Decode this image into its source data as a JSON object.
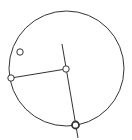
{
  "diagram": {
    "type": "geometry",
    "canvas": {
      "width": 132,
      "height": 140,
      "background": "#ffffff"
    },
    "stroke_color": "#333333",
    "circle": {
      "cx": 66.5,
      "cy": 68.5,
      "r": 57.5
    },
    "segments": [
      {
        "name": "radius-segment",
        "x1": 11,
        "y1": 78,
        "x2": 66,
        "y2": 69
      },
      {
        "name": "diameter-line",
        "x1": 62,
        "y1": 44,
        "x2": 78,
        "y2": 138
      }
    ],
    "points": [
      {
        "name": "free-point",
        "x": 20,
        "y": 52,
        "r": 3.2,
        "stroke_width": 1
      },
      {
        "name": "left-point",
        "x": 11,
        "y": 78,
        "r": 3.2,
        "stroke_width": 1
      },
      {
        "name": "center-point",
        "x": 66,
        "y": 69,
        "r": 3.2,
        "stroke_width": 1
      },
      {
        "name": "bottom-point",
        "x": 75.5,
        "y": 125,
        "r": 3.5,
        "stroke_width": 1.8
      }
    ]
  }
}
